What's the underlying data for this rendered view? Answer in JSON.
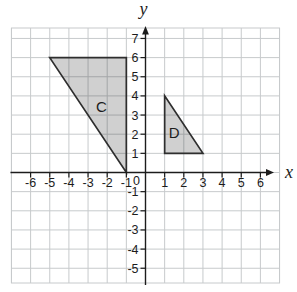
{
  "figure": {
    "background_color": "#ffffff",
    "grid_color": "#c7cacc",
    "axis_color": "#1c1c1c",
    "text_color": "#1c1c1c",
    "axes": {
      "x_name": "x",
      "y_name": "y",
      "origin_label": "0",
      "x_tick_labels": [
        -6,
        -5,
        -4,
        -3,
        -2,
        -1,
        1,
        2,
        3,
        4,
        5,
        6
      ],
      "y_tick_labels": [
        7,
        6,
        5,
        4,
        3,
        2,
        1,
        -1,
        -2,
        -3,
        -4,
        -5
      ],
      "x_gridline_min": -7,
      "x_gridline_max": 7,
      "y_gridline_min": -5,
      "y_gridline_max": 7
    },
    "shapes": [
      {
        "id": "C",
        "label": "C",
        "vertices": [
          [
            -5,
            6
          ],
          [
            -1,
            6
          ],
          [
            -1,
            0
          ]
        ],
        "label_position": [
          -2.3,
          3.4
        ],
        "fill_color": "rgba(40,40,40,0.22)",
        "stroke_color": "#2e2e2e"
      },
      {
        "id": "D",
        "label": "D",
        "vertices": [
          [
            1,
            4
          ],
          [
            1,
            1
          ],
          [
            3,
            1
          ]
        ],
        "label_position": [
          1.5,
          2.05
        ],
        "fill_color": "rgba(40,40,40,0.22)",
        "stroke_color": "#2e2e2e"
      }
    ]
  }
}
